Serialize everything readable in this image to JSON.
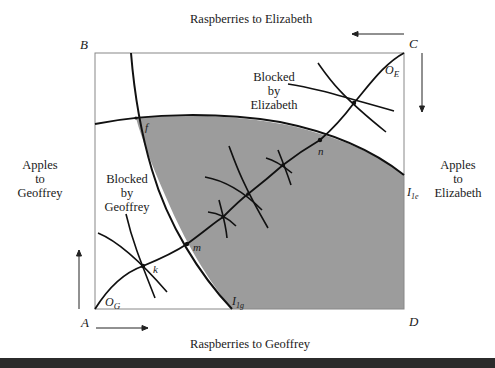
{
  "diagram": {
    "type": "Edgeworth box",
    "axes": {
      "top": "Raspberries to Elizabeth",
      "bottom": "Raspberries to Geoffrey",
      "left": [
        "Apples",
        "to",
        "Geoffrey"
      ],
      "right": [
        "Apples",
        "to",
        "Elizabeth"
      ]
    },
    "corners": {
      "top_left": "B",
      "top_right": "C",
      "bottom_left": "A",
      "bottom_right": "D"
    },
    "origins": {
      "geoffrey": "O",
      "geoffrey_sub": "G",
      "elizabeth": "O",
      "elizabeth_sub": "E"
    },
    "curves": {
      "geoffrey_indifference": "I",
      "geoffrey_indifference_sub": "1g",
      "elizabeth_indifference": "I",
      "elizabeth_indifference_sub": "1e"
    },
    "points": {
      "f": "f",
      "k": "k",
      "m": "m",
      "n": "n"
    },
    "region_labels": {
      "blocked_geoffrey": [
        "Blocked",
        "by",
        "Geoffrey"
      ],
      "blocked_elizabeth": [
        "Blocked",
        "by",
        "Elizabeth"
      ]
    },
    "colors": {
      "shaded_region": "#9c9c9c",
      "line": "#111111",
      "box": "#888888"
    }
  }
}
